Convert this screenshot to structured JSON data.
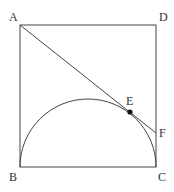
{
  "diagram": {
    "points": {
      "A": {
        "label": "A",
        "x": 20,
        "y": 25
      },
      "B": {
        "label": "B",
        "x": 20,
        "y": 167
      },
      "C": {
        "label": "C",
        "x": 156,
        "y": 167
      },
      "D": {
        "label": "D",
        "x": 156,
        "y": 25
      },
      "E": {
        "label": "E",
        "x": 130,
        "y": 112
      },
      "F": {
        "label": "F",
        "x": 156,
        "y": 133
      }
    },
    "colors": {
      "stroke": "#444444",
      "text": "#333333",
      "background": "#ffffff"
    }
  }
}
